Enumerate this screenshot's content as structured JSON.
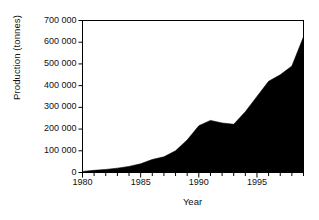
{
  "chart_data": {
    "type": "area",
    "title": "",
    "xlabel": "Year",
    "ylabel": "Production (tonnes)",
    "xlim": [
      1980,
      1999
    ],
    "ylim": [
      0,
      700000
    ],
    "grid": false,
    "legend": "none",
    "series_color": "#000000",
    "x": [
      1980,
      1981,
      1982,
      1983,
      1984,
      1985,
      1986,
      1987,
      1988,
      1989,
      1990,
      1991,
      1992,
      1993,
      1994,
      1995,
      1996,
      1997,
      1998,
      1999
    ],
    "values": [
      5000,
      10000,
      14000,
      20000,
      28000,
      40000,
      60000,
      72000,
      100000,
      150000,
      215000,
      240000,
      228000,
      222000,
      280000,
      350000,
      420000,
      450000,
      490000,
      625000
    ],
    "series": [
      {
        "name": "Production",
        "values": [
          5000,
          10000,
          14000,
          20000,
          28000,
          40000,
          60000,
          72000,
          100000,
          150000,
          215000,
          240000,
          228000,
          222000,
          280000,
          350000,
          420000,
          450000,
          490000,
          625000
        ]
      }
    ],
    "y_ticks": [
      0,
      100000,
      200000,
      300000,
      400000,
      500000,
      600000,
      700000
    ],
    "y_tick_labels": [
      "0",
      "100 000",
      "200 000",
      "300 000",
      "400 000",
      "500 000",
      "600 000",
      "700 000"
    ],
    "x_ticks": [
      1980,
      1985,
      1990,
      1995
    ],
    "x_tick_labels": [
      "1980",
      "1985",
      "1990",
      "1995"
    ],
    "x_minor_tick_interval": 1,
    "annotations": []
  },
  "axes": {
    "y_title": "Production (tonnes)",
    "x_title": "Year"
  }
}
